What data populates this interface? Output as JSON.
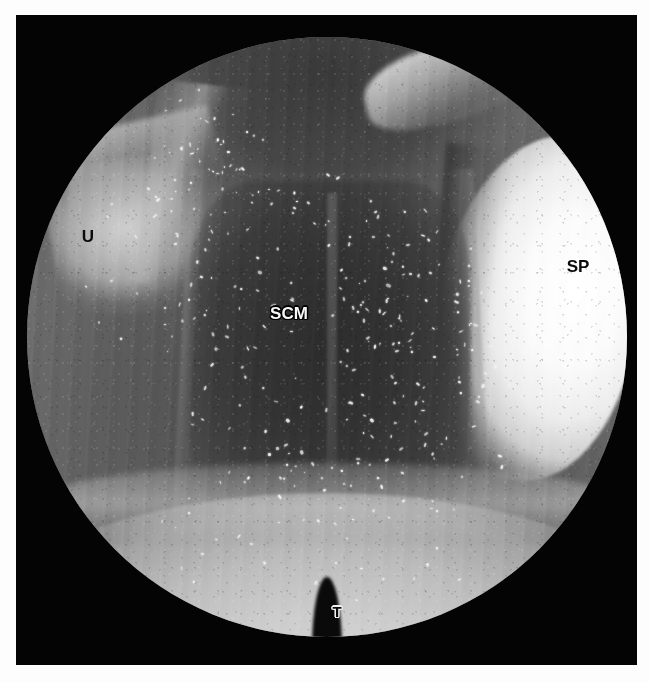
{
  "figure": {
    "kind": "endoscopic-photograph",
    "modality": "nasopharyngoscopy",
    "color_mode": "grayscale",
    "field_of_view_shape": "circular",
    "plate_background_color": "#040404",
    "page_background_color": "#ffffff"
  },
  "labels": [
    {
      "id": "uvula",
      "text": "U",
      "meaning": "uvula",
      "style": "dark",
      "font_size_px": 17,
      "x_px": 88,
      "y_px": 236
    },
    {
      "id": "soft-palate",
      "text": "SP",
      "meaning": "soft palate",
      "style": "dark",
      "font_size_px": 17,
      "x_px": 578,
      "y_px": 266
    },
    {
      "id": "superior-constrictor-muscle",
      "text": "SCM",
      "meaning": "superior constrictor muscle",
      "style": "light",
      "font_size_px": 17,
      "x_px": 289,
      "y_px": 313
    },
    {
      "id": "tongue",
      "text": "T",
      "meaning": "tongue",
      "style": "dark-outlined",
      "font_size_px": 15,
      "x_px": 337,
      "y_px": 611
    }
  ],
  "regions": [
    {
      "id": "uvula-region",
      "name": "bright uvular prominence",
      "location": "upper-left",
      "tone": "bright"
    },
    {
      "id": "soft-palate-region",
      "name": "soft palate crescent",
      "location": "right",
      "tone": "very-bright"
    },
    {
      "id": "scm-region",
      "name": "posterior pharyngeal wall / superior constrictor",
      "location": "center",
      "tone": "dark"
    },
    {
      "id": "tongue-region",
      "name": "tongue base",
      "location": "bottom",
      "tone": "bright"
    },
    {
      "id": "lateral-walls",
      "name": "lateral pharyngeal walls",
      "location": "left-and-right",
      "tone": "mid-grey"
    }
  ],
  "speckles": {
    "description": "specular highlights from mucous secretions",
    "color": "#f4f4f4",
    "count": 330
  }
}
